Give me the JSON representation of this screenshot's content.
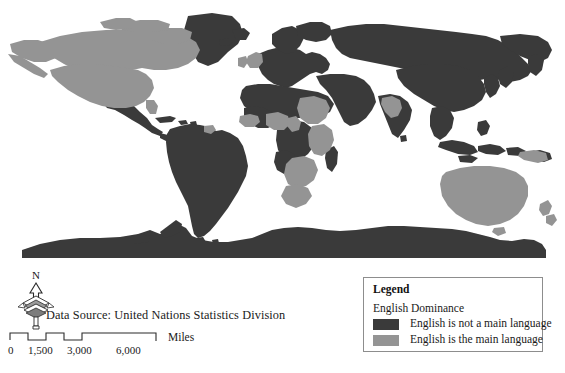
{
  "map": {
    "title": "World English Dominance Map",
    "projection": "robinson-like world map",
    "background_color": "#ffffff",
    "colors": {
      "not_main_language": "#3a3a3a",
      "main_language": "#949494",
      "ocean": "#ffffff",
      "outline": "#8d8d8d"
    },
    "regions_main_language": [
      "United States",
      "Canada",
      "Alaska",
      "United Kingdom",
      "Ireland",
      "Australia",
      "New Zealand",
      "Nigeria",
      "Ghana",
      "Kenya",
      "Uganda",
      "Tanzania",
      "Zambia",
      "Zimbabwe",
      "Botswana",
      "Namibia",
      "South Africa",
      "Sierra Leone",
      "Liberia",
      "Cameroon",
      "Sudan",
      "Guyana",
      "India",
      "Papua New Guinea"
    ],
    "regions_not_main_language": [
      "Mexico",
      "Greenland",
      "South America",
      "Europe",
      "Russia",
      "China",
      "Middle East",
      "North Africa",
      "Central Africa",
      "Southeast Asia",
      "Antarctica"
    ]
  },
  "north_arrow": {
    "label": "N",
    "icon": "compass-rose-icon"
  },
  "data_source": {
    "text": "Data Source: United Nations Statistics Division"
  },
  "scale_bar": {
    "unit_label": "Miles",
    "ticks": [
      "0",
      "1,500",
      "3,000",
      "6,000"
    ],
    "tick_positions": [
      0,
      36,
      80,
      128
    ]
  },
  "legend": {
    "title": "Legend",
    "subtitle": "English Dominance",
    "items": [
      {
        "label": "English is not a main language",
        "color": "#3a3a3a",
        "swatch_name": "legend-swatch-dark"
      },
      {
        "label": "English is the main language",
        "color": "#949494",
        "swatch_name": "legend-swatch-light"
      }
    ]
  }
}
